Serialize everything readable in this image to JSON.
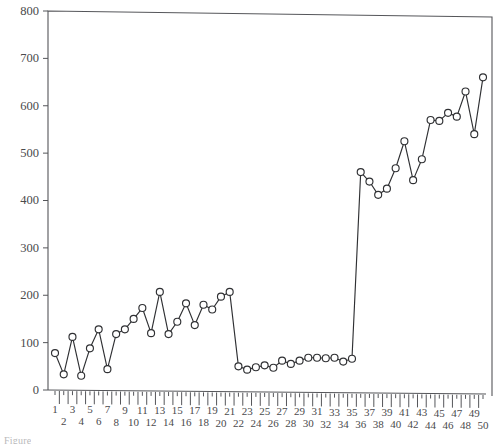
{
  "chart_data": {
    "type": "line",
    "title": "",
    "subtitle": "",
    "xlabel": "",
    "ylabel": "",
    "xlim": [
      0.5,
      50.5
    ],
    "ylim": [
      0,
      800
    ],
    "grid": false,
    "legend": null,
    "marker": "open-circle",
    "x": [
      1,
      2,
      3,
      4,
      5,
      6,
      7,
      8,
      9,
      10,
      11,
      12,
      13,
      14,
      15,
      16,
      17,
      18,
      19,
      20,
      21,
      22,
      23,
      24,
      25,
      26,
      27,
      28,
      29,
      30,
      31,
      32,
      33,
      34,
      35,
      36,
      37,
      38,
      39,
      40,
      41,
      42,
      43,
      44,
      45,
      46,
      47,
      48,
      49,
      50
    ],
    "xtick_labels_odd": [
      "1",
      "3",
      "5",
      "7",
      "9",
      "11",
      "13",
      "15",
      "17",
      "19",
      "21",
      "23",
      "25",
      "27",
      "29",
      "31",
      "33",
      "35",
      "37",
      "39",
      "41",
      "43",
      "45",
      "47",
      "49"
    ],
    "xtick_labels_even": [
      "2",
      "4",
      "6",
      "8",
      "10",
      "12",
      "14",
      "16",
      "18",
      "20",
      "22",
      "24",
      "26",
      "28",
      "30",
      "32",
      "34",
      "36",
      "38",
      "40",
      "42",
      "44",
      "46",
      "48",
      "50"
    ],
    "ytick_labels": [
      "0",
      "100",
      "200",
      "300",
      "400",
      "500",
      "600",
      "700",
      "800"
    ],
    "ytick_values": [
      0,
      100,
      200,
      300,
      400,
      500,
      600,
      700,
      800
    ],
    "series": [
      {
        "name": "series-1",
        "color": "#2f3033",
        "values": [
          78,
          33,
          112,
          30,
          88,
          128,
          44,
          118,
          128,
          150,
          173,
          120,
          207,
          118,
          144,
          183,
          137,
          180,
          170,
          197,
          207,
          50,
          43,
          48,
          52,
          47,
          62,
          55,
          62,
          68,
          68,
          67,
          68,
          60,
          66,
          460,
          440,
          412,
          425,
          468,
          525,
          443,
          487,
          570,
          568,
          585,
          577,
          630,
          540,
          660
        ]
      }
    ]
  },
  "caption": {
    "text": "Figure"
  }
}
